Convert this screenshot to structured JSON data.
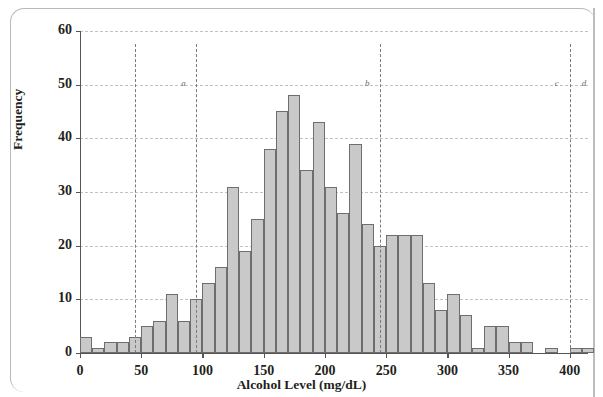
{
  "chart_data": {
    "type": "bar",
    "title": "",
    "subtitle": "",
    "xlabel": "Alcohol Level (mg/dL)",
    "ylabel": "Frequency",
    "xlim": [
      0,
      415
    ],
    "ylim": [
      0,
      60
    ],
    "bin_width": 10,
    "grid": true,
    "legend": null,
    "xticks": [
      0,
      50,
      100,
      150,
      200,
      250,
      300,
      350,
      400
    ],
    "xtick_labels": [
      "0",
      "50",
      "100",
      "150",
      "200",
      "250",
      "300",
      "350",
      "400"
    ],
    "yticks": [
      0,
      10,
      20,
      30,
      40,
      50,
      60
    ],
    "ytick_labels": [
      "0",
      "10",
      "20",
      "30",
      "40",
      "50",
      "60"
    ],
    "bin_starts": [
      0,
      10,
      20,
      30,
      40,
      50,
      60,
      70,
      80,
      90,
      100,
      110,
      120,
      130,
      140,
      150,
      160,
      170,
      180,
      190,
      200,
      210,
      220,
      230,
      240,
      250,
      260,
      270,
      280,
      290,
      300,
      310,
      320,
      330,
      340,
      350,
      360,
      370,
      380,
      390,
      400,
      410
    ],
    "values": [
      3,
      1,
      2,
      2,
      3,
      5,
      6,
      11,
      6,
      10,
      13,
      16,
      31,
      19,
      25,
      38,
      45,
      48,
      34,
      43,
      31,
      26,
      39,
      24,
      20,
      22,
      22,
      22,
      13,
      8,
      11,
      7,
      1,
      5,
      5,
      2,
      2,
      0,
      1,
      0,
      1,
      1
    ],
    "annotations": [
      {
        "label": "",
        "x": 45,
        "type": "vertical-dashed-line"
      },
      {
        "label": "a",
        "x": 95,
        "type": "vertical-dashed-line"
      },
      {
        "label": "b",
        "x": 245,
        "type": "vertical-dashed-line"
      },
      {
        "label": "c",
        "x": 400,
        "type": "vertical-dashed-line"
      },
      {
        "label": "d",
        "x": 400,
        "type": "right-of-line-label"
      }
    ]
  },
  "axes": {
    "x_title": "Alcohol Level (mg/dL)",
    "y_title": "Frequency"
  },
  "reference_letters": {
    "a": "a",
    "b": "b",
    "c": "c",
    "d": "d"
  },
  "colors": {
    "bar_fill": "#c9c9c9",
    "bar_stroke": "#6e6e6e",
    "grid": "#c2c2c2",
    "refline": "#7a7a7a",
    "text": "#231f20"
  }
}
